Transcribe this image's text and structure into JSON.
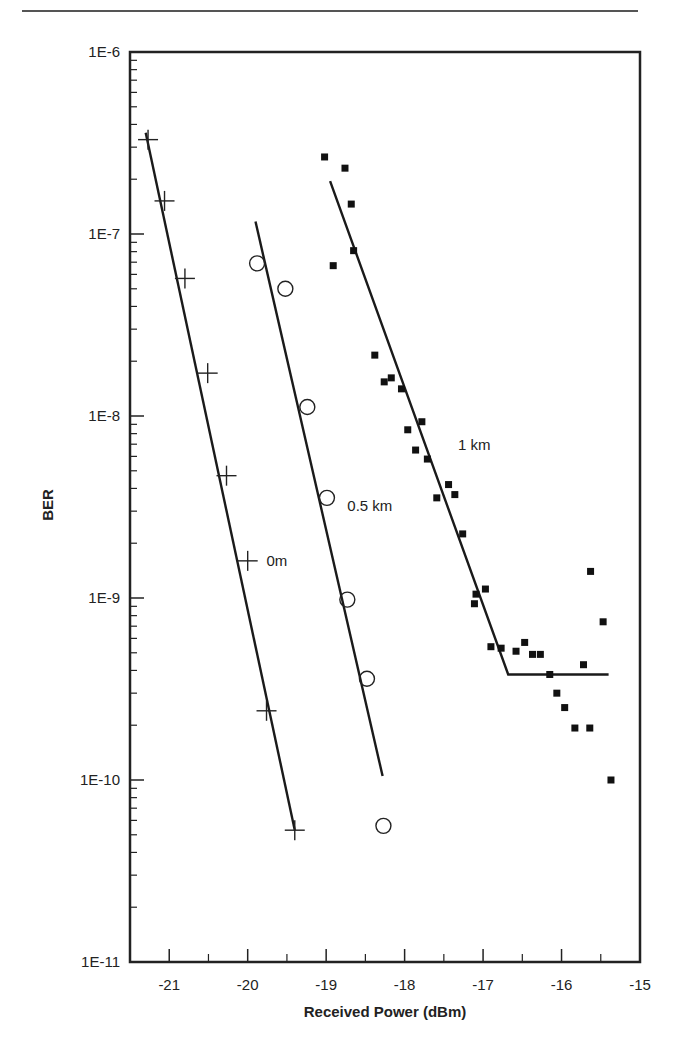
{
  "chart_data": {
    "type": "scatter",
    "title": "",
    "xlabel": "Received Power (dBm)",
    "ylabel": "BER",
    "xlim": [
      -21.5,
      -15
    ],
    "ylim": [
      1e-11,
      1e-06
    ],
    "yscale": "log",
    "grid": false,
    "legend": "none (inline labels)",
    "x_ticks": [
      -21,
      -20,
      -19,
      -18,
      -17,
      -16,
      -15
    ],
    "x_tick_labels": [
      "-21",
      "-20",
      "-19",
      "-18",
      "-17",
      "-16",
      "-15"
    ],
    "y_ticks": [
      1e-06,
      1e-07,
      1e-08,
      1e-09,
      1e-10,
      1e-11
    ],
    "y_tick_labels": [
      "1E-6",
      "1E-7",
      "1E-8",
      "1E-9",
      "1E-10",
      "1E-11"
    ],
    "series": [
      {
        "name": "0m",
        "marker": "plus",
        "label": "0m",
        "label_pos": [
          -19.76,
          1.5e-09
        ],
        "x": [
          -21.27,
          -21.06,
          -20.8,
          -20.51,
          -20.27,
          -20.0,
          -19.76,
          -19.4
        ],
        "y": [
          3.3e-07,
          1.52e-07,
          5.7e-08,
          1.72e-08,
          4.7e-09,
          1.6e-09,
          2.4e-10,
          5.3e-11
        ],
        "fit_line": {
          "x": [
            -21.3,
            -19.4
          ],
          "y": [
            3.6e-07,
            5.3e-11
          ]
        }
      },
      {
        "name": "0.5 km",
        "marker": "circle",
        "label": "0.5 km",
        "label_pos": [
          -18.73,
          3e-09
        ],
        "x": [
          -19.88,
          -19.52,
          -19.24,
          -18.99,
          -18.73,
          -18.48,
          -18.27
        ],
        "y": [
          6.9e-08,
          5e-08,
          1.12e-08,
          3.55e-09,
          9.8e-10,
          3.6e-10,
          5.6e-11
        ],
        "fit_line": {
          "x": [
            -19.9,
            -18.28
          ],
          "y": [
            1.17e-07,
            1.05e-10
          ]
        }
      },
      {
        "name": "1 km",
        "marker": "square",
        "label": "1 km",
        "label_pos": [
          -17.32,
          6.5e-09
        ],
        "x": [
          -19.02,
          -18.76,
          -18.68,
          -18.65,
          -18.91,
          -18.38,
          -18.26,
          -18.17,
          -18.04,
          -17.96,
          -17.78,
          -17.86,
          -17.71,
          -17.59,
          -17.44,
          -17.36,
          -17.26,
          -17.09,
          -17.11,
          -16.97,
          -16.9,
          -16.77,
          -16.58,
          -16.47,
          -16.37,
          -16.27,
          -16.15,
          -16.06,
          -15.96,
          -15.83,
          -15.64,
          -15.72,
          -15.63,
          -15.47,
          -15.37
        ],
        "y": [
          2.65e-07,
          2.3e-07,
          1.46e-07,
          8.1e-08,
          6.7e-08,
          2.16e-08,
          1.54e-08,
          1.62e-08,
          1.41e-08,
          8.4e-09,
          9.3e-09,
          6.5e-09,
          5.8e-09,
          3.55e-09,
          4.2e-09,
          3.7e-09,
          2.25e-09,
          1.05e-09,
          9.3e-10,
          1.12e-09,
          5.4e-10,
          5.3e-10,
          5.1e-10,
          5.7e-10,
          4.9e-10,
          4.9e-10,
          3.8e-10,
          3e-10,
          2.5e-10,
          1.93e-10,
          1.93e-10,
          4.3e-10,
          1.4e-09,
          7.4e-10,
          1e-10
        ],
        "fit_line": {
          "x": [
            -18.95,
            -16.68,
            -15.4
          ],
          "y": [
            1.95e-07,
            3.8e-10,
            3.8e-10
          ]
        }
      }
    ]
  }
}
